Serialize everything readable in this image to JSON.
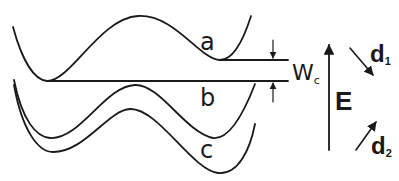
{
  "diagram": {
    "curves": [
      {
        "id": "a",
        "label": "a"
      },
      {
        "id": "b",
        "label": "b"
      },
      {
        "id": "c",
        "label": "c"
      }
    ],
    "gap": {
      "label_main": "W",
      "label_sub": "c"
    },
    "field": {
      "label": "E"
    },
    "directions": [
      {
        "label_main": "d",
        "label_sub": "1"
      },
      {
        "label_main": "d",
        "label_sub": "2"
      }
    ],
    "colors": {
      "line": "#1a1a1a",
      "background": "#ffffff"
    }
  }
}
